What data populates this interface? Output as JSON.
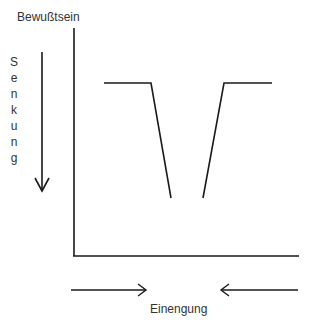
{
  "diagram": {
    "y_axis_label": "Bewußtsein",
    "x_axis_label": "Einengung",
    "vertical_label_letters": [
      "S",
      "e",
      "n",
      "k",
      "u",
      "n",
      "g"
    ],
    "vertical_label": "Senkung",
    "line_color": "#1a1a1a",
    "shape": "V-shaped dip: flat high plateau on left, drops steeply toward center (bottom gap), rises steeply to flat plateau on right",
    "arrows": {
      "vertical": "down arrow beside Senkung",
      "horizontal_left": "right-pointing arrow",
      "horizontal_right": "left-pointing arrow"
    }
  }
}
